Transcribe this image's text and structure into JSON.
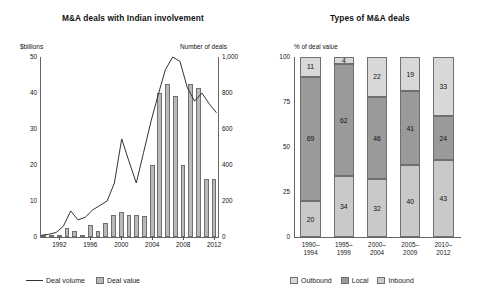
{
  "left": {
    "title": "M&A deals with Indian involvement",
    "y_left_caption": "$billions",
    "y_right_caption": "Number of deals",
    "legend": [
      {
        "key": "volume",
        "label": "Deal volume",
        "marker": "line"
      },
      {
        "key": "value",
        "label": "Deal value",
        "marker": "swatch"
      }
    ]
  },
  "right": {
    "title": "Types of M&A deals",
    "y_caption": "% of deal value",
    "legend": [
      {
        "key": "outbound",
        "label": "Outbound",
        "color": "#d8d8d8"
      },
      {
        "key": "local",
        "label": "Local",
        "color": "#9a9a9a"
      },
      {
        "key": "inbound",
        "label": "Inbound",
        "color": "#c9c9c9"
      }
    ]
  },
  "chart_data": [
    {
      "type": "bar",
      "id": "ma-deals-india",
      "title": "M&A deals with Indian involvement",
      "xlabel": "",
      "ylabel": "$billions",
      "y2label": "Number of deals",
      "ylim": [
        0,
        50
      ],
      "y2lim": [
        0,
        1000
      ],
      "yticks": [
        "0",
        "10",
        "20",
        "30",
        "40",
        "50"
      ],
      "y2ticks": [
        "0",
        "200",
        "400",
        "600",
        "800",
        "1,000"
      ],
      "grid": false,
      "legend_position": "bottom-left",
      "x": [
        1990,
        1991,
        1992,
        1993,
        1994,
        1995,
        1996,
        1997,
        1998,
        1999,
        2000,
        2001,
        2002,
        2003,
        2004,
        2005,
        2006,
        2007,
        2008,
        2009,
        2010,
        2011,
        2012
      ],
      "xtick_labels": [
        "1992",
        "1996",
        "2000",
        "2004",
        "2008",
        "2012"
      ],
      "xticks": [
        1992,
        1996,
        2000,
        2004,
        2008,
        2012
      ],
      "series": [
        {
          "name": "Deal value",
          "type": "bar",
          "axis": "left",
          "unit": "$billions",
          "values": [
            0.2,
            0.3,
            0.4,
            2.5,
            1.6,
            0.3,
            3.4,
            1.6,
            3.8,
            6.2,
            7.0,
            6.0,
            6.0,
            5.8,
            20.0,
            40.0,
            42.5,
            39.3,
            20.0,
            42.5,
            41.3,
            16.0,
            16.0
          ]
        },
        {
          "name": "Deal volume",
          "type": "line",
          "axis": "right",
          "unit": "Number of deals",
          "values": [
            10,
            15,
            25,
            60,
            145,
            95,
            110,
            150,
            175,
            200,
            300,
            545,
            420,
            300,
            470,
            640,
            790,
            930,
            1000,
            975,
            830,
            755,
            800,
            740,
            690
          ]
        }
      ]
    },
    {
      "type": "bar",
      "id": "types-of-ma-deals",
      "title": "Types of M&A deals",
      "subtype": "stacked-100",
      "xlabel": "",
      "ylabel": "% of deal value",
      "ylim": [
        0,
        100
      ],
      "yticks": [
        "0",
        "25",
        "50",
        "75",
        "100"
      ],
      "grid": false,
      "legend_position": "bottom",
      "categories": [
        "1990–\n1994",
        "1995–\n1999",
        "2000–\n2004",
        "2005–\n2009",
        "2010–\n2012"
      ],
      "category_lines": [
        [
          "1990–",
          "1994"
        ],
        [
          "1995–",
          "1999"
        ],
        [
          "2000–",
          "2004"
        ],
        [
          "2005–",
          "2009"
        ],
        [
          "2010–",
          "2012"
        ]
      ],
      "series": [
        {
          "name": "Inbound",
          "color": "#c9c9c9",
          "values": [
            20,
            34,
            32,
            40,
            43
          ]
        },
        {
          "name": "Local",
          "color": "#9a9a9a",
          "values": [
            69,
            62,
            46,
            41,
            24
          ]
        },
        {
          "name": "Outbound",
          "color": "#d8d8d8",
          "values": [
            11,
            4,
            22,
            19,
            33
          ]
        }
      ]
    }
  ]
}
